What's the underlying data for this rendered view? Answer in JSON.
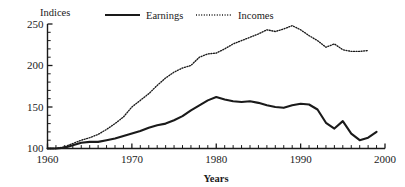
{
  "chart_data": {
    "type": "line",
    "title": "",
    "subtitle": "",
    "xlabel": "Years",
    "ylabel": "Indices",
    "xlim": [
      1960,
      2000
    ],
    "ylim": [
      100,
      250
    ],
    "grid": false,
    "legend_position": "top",
    "x_ticks_labeled": [
      "1960",
      "1970",
      "1980",
      "1990",
      "2000"
    ],
    "x_tick_values": [
      1960,
      1970,
      1980,
      1990,
      2000
    ],
    "x_minor_tick_interval": 1,
    "y_ticks_labeled": [
      "100",
      "150",
      "200",
      "250"
    ],
    "y_tick_values": [
      100,
      150,
      200,
      250
    ],
    "y_minor_tick_interval": 10,
    "series": [
      {
        "name": "Earnings",
        "style": "solid",
        "color": "#1a1a1a",
        "x": [
          1960,
          1961,
          1962,
          1963,
          1964,
          1965,
          1966,
          1967,
          1968,
          1969,
          1970,
          1971,
          1972,
          1973,
          1974,
          1975,
          1976,
          1977,
          1978,
          1979,
          1980,
          1981,
          1982,
          1983,
          1984,
          1985,
          1986,
          1987,
          1988,
          1989,
          1990,
          1991,
          1992,
          1993,
          1994,
          1995,
          1996,
          1997,
          1998
        ],
        "values": [
          100,
          100,
          101,
          104,
          107,
          108,
          108,
          110,
          112,
          115,
          118,
          121,
          125,
          128,
          130,
          134,
          139,
          146,
          152,
          158,
          162,
          159,
          157,
          156,
          157,
          155,
          152,
          150,
          149,
          152,
          154,
          153,
          147,
          145,
          142,
          138,
          132,
          130,
          127
        ]
      },
      {
        "name": "Incomes",
        "style": "dotted",
        "color": "#1a1a1a",
        "x": [
          1960,
          1961,
          1962,
          1963,
          1964,
          1965,
          1966,
          1967,
          1968,
          1969,
          1970,
          1971,
          1972,
          1973,
          1974,
          1975,
          1976,
          1977,
          1978,
          1979,
          1980,
          1981,
          1982,
          1983,
          1984,
          1985,
          1986,
          1987,
          1988,
          1989,
          1990,
          1991,
          1992,
          1993,
          1994,
          1995,
          1996,
          1997,
          1998
        ],
        "values": [
          100,
          100,
          102,
          106,
          110,
          113,
          117,
          123,
          130,
          138,
          150,
          158,
          166,
          176,
          185,
          192,
          197,
          200,
          210,
          214,
          215,
          220,
          226,
          230,
          234,
          238,
          243,
          241,
          244,
          248,
          243,
          236,
          230,
          222,
          226,
          219,
          217,
          217,
          218
        ]
      }
    ],
    "series_extra": {
      "earnings_tail": {
        "x": [
          1992,
          1993,
          1994,
          1995,
          1996,
          1997,
          1998
        ],
        "values": [
          147,
          131,
          124,
          133,
          118,
          110,
          113,
          120
        ]
      }
    },
    "annotations": []
  },
  "legend": {
    "items": [
      {
        "label": "Earnings",
        "style": "solid"
      },
      {
        "label": "Incomes",
        "style": "dotted"
      }
    ]
  },
  "axes": {
    "ylabel": "Indices",
    "xtitle": "Years",
    "ytick_labels": [
      "250",
      "200",
      "150",
      "100"
    ],
    "xtick_labels": [
      "1960",
      "1970",
      "1980",
      "1990",
      "2000"
    ]
  }
}
